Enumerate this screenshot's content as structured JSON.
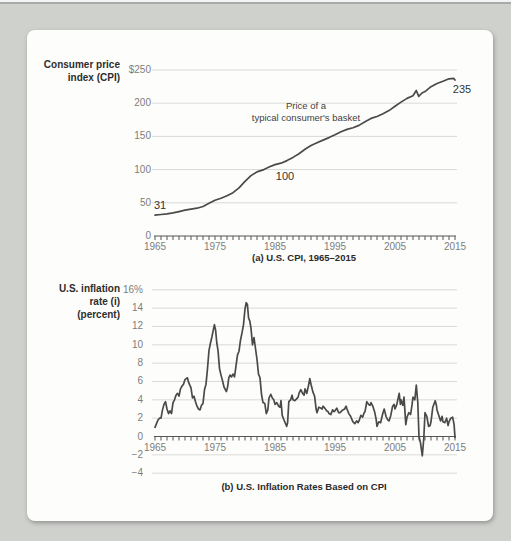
{
  "colors": {
    "page_bg": "#cfd1cd",
    "card_bg": "#fdfdfb",
    "top_rule": "#a9a9a9",
    "series_line": "#4a4a4a",
    "gridline": "#d9d9d9",
    "axis": "#555555",
    "tick_text": "#7d7d7d",
    "label_text": "#2d2d2d"
  },
  "chart_data": [
    {
      "id": "us-cpi",
      "type": "line",
      "title": "(a) U.S. CPI, 1965–2015",
      "ylabel_lines": [
        "Consumer price",
        "index (CPI)"
      ],
      "annotation_lines": [
        "Price of a",
        "typical consumer's basket"
      ],
      "point_labels": [
        {
          "text": "31",
          "year": 1965,
          "value": 31
        },
        {
          "text": "100",
          "year": 1983,
          "value": 100
        },
        {
          "text": "235",
          "year": 2015,
          "value": 235
        }
      ],
      "x_range": [
        1965,
        2015
      ],
      "ylim": [
        0,
        250
      ],
      "grid": true,
      "legend": "none",
      "yticks": [
        {
          "v": 250,
          "label": "$250"
        },
        {
          "v": 200,
          "label": "200"
        },
        {
          "v": 150,
          "label": "150"
        },
        {
          "v": 100,
          "label": "100"
        },
        {
          "v": 50,
          "label": "50"
        },
        {
          "v": 0,
          "label": "0"
        }
      ],
      "xticks": [
        1965,
        1975,
        1985,
        1995,
        2005,
        2015
      ],
      "series": [
        [
          1965,
          31.5
        ],
        [
          1966,
          32.4
        ],
        [
          1967,
          33.4
        ],
        [
          1968,
          34.8
        ],
        [
          1969,
          36.7
        ],
        [
          1970,
          38.8
        ],
        [
          1971,
          40.5
        ],
        [
          1972,
          41.8
        ],
        [
          1973,
          44.4
        ],
        [
          1974,
          49.3
        ],
        [
          1975,
          53.8
        ],
        [
          1976,
          56.9
        ],
        [
          1977,
          60.6
        ],
        [
          1978,
          65.2
        ],
        [
          1979,
          72.6
        ],
        [
          1980,
          82.4
        ],
        [
          1981,
          90.9
        ],
        [
          1982,
          96.5
        ],
        [
          1983,
          99.6
        ],
        [
          1984,
          103.9
        ],
        [
          1985,
          107.6
        ],
        [
          1986,
          109.6
        ],
        [
          1987,
          113.6
        ],
        [
          1988,
          118.3
        ],
        [
          1989,
          124.0
        ],
        [
          1990,
          130.7
        ],
        [
          1991,
          136.2
        ],
        [
          1992,
          140.3
        ],
        [
          1993,
          144.5
        ],
        [
          1994,
          148.2
        ],
        [
          1995,
          152.4
        ],
        [
          1996,
          156.9
        ],
        [
          1997,
          160.5
        ],
        [
          1998,
          163.0
        ],
        [
          1999,
          166.6
        ],
        [
          2000,
          172.2
        ],
        [
          2001,
          177.1
        ],
        [
          2002,
          179.9
        ],
        [
          2003,
          184.0
        ],
        [
          2004,
          188.9
        ],
        [
          2005,
          195.3
        ],
        [
          2006,
          201.6
        ],
        [
          2007,
          207.3
        ],
        [
          2008,
          211.1
        ],
        [
          2008.55,
          219.1
        ],
        [
          2008.95,
          210.2
        ],
        [
          2009.5,
          215.3
        ],
        [
          2010,
          217.5
        ],
        [
          2011,
          224.9
        ],
        [
          2012,
          229.6
        ],
        [
          2013,
          233.0
        ],
        [
          2014,
          236.7
        ],
        [
          2014.8,
          237.4
        ],
        [
          2015,
          234.8
        ]
      ]
    },
    {
      "id": "us-inflation",
      "type": "line",
      "title": "(b) U.S. Inflation Rates Based on CPI",
      "ylabel_lines": [
        "U.S. inflation",
        "rate (i)",
        "(percent)"
      ],
      "annotation_lines": [],
      "point_labels": [],
      "x_range": [
        1965,
        2015
      ],
      "ylim": [
        -4,
        16
      ],
      "grid": true,
      "legend": "none",
      "yticks": [
        {
          "v": 16,
          "label": "16%"
        },
        {
          "v": 14,
          "label": "14"
        },
        {
          "v": 12,
          "label": "12"
        },
        {
          "v": 10,
          "label": "10"
        },
        {
          "v": 8,
          "label": "8"
        },
        {
          "v": 6,
          "label": "6"
        },
        {
          "v": 4,
          "label": "4"
        },
        {
          "v": 2,
          "label": "2"
        },
        {
          "v": 0,
          "label": "0"
        },
        {
          "v": -2,
          "label": "−2"
        },
        {
          "v": -4,
          "label": "−4"
        }
      ],
      "xticks": [
        1965,
        1975,
        1985,
        1995,
        2005,
        2015
      ],
      "series": [
        [
          1965,
          1.0
        ],
        [
          1965.25,
          1.4
        ],
        [
          1965.5,
          1.8
        ],
        [
          1965.75,
          2.0
        ],
        [
          1966,
          2.0
        ],
        [
          1966.25,
          2.9
        ],
        [
          1966.5,
          3.5
        ],
        [
          1966.75,
          3.8
        ],
        [
          1967,
          3.0
        ],
        [
          1967.25,
          2.5
        ],
        [
          1967.5,
          2.8
        ],
        [
          1967.75,
          2.5
        ],
        [
          1968,
          3.7
        ],
        [
          1968.25,
          4.0
        ],
        [
          1968.5,
          4.5
        ],
        [
          1968.75,
          4.7
        ],
        [
          1969,
          4.4
        ],
        [
          1969.25,
          5.2
        ],
        [
          1969.5,
          5.5
        ],
        [
          1969.75,
          5.7
        ],
        [
          1970,
          6.2
        ],
        [
          1970.4,
          6.4
        ],
        [
          1970.6,
          5.9
        ],
        [
          1970.8,
          5.6
        ],
        [
          1971,
          5.3
        ],
        [
          1971.25,
          4.2
        ],
        [
          1971.5,
          4.4
        ],
        [
          1971.75,
          3.8
        ],
        [
          1972,
          3.3
        ],
        [
          1972.25,
          3.0
        ],
        [
          1972.5,
          2.9
        ],
        [
          1972.75,
          3.4
        ],
        [
          1973,
          3.6
        ],
        [
          1973.25,
          5.1
        ],
        [
          1973.5,
          5.7
        ],
        [
          1973.75,
          7.4
        ],
        [
          1974,
          9.4
        ],
        [
          1974.25,
          10.2
        ],
        [
          1974.5,
          10.9
        ],
        [
          1974.9,
          12.2
        ],
        [
          1975.1,
          11.6
        ],
        [
          1975.3,
          10.2
        ],
        [
          1975.5,
          9.4
        ],
        [
          1975.75,
          7.4
        ],
        [
          1976,
          6.7
        ],
        [
          1976.25,
          6.1
        ],
        [
          1976.5,
          5.4
        ],
        [
          1976.9,
          4.9
        ],
        [
          1977.1,
          5.4
        ],
        [
          1977.3,
          6.4
        ],
        [
          1977.5,
          6.7
        ],
        [
          1977.75,
          6.5
        ],
        [
          1978,
          6.8
        ],
        [
          1978.25,
          6.5
        ],
        [
          1978.5,
          7.7
        ],
        [
          1978.75,
          8.9
        ],
        [
          1979,
          9.3
        ],
        [
          1979.25,
          10.5
        ],
        [
          1979.5,
          11.3
        ],
        [
          1979.75,
          12.2
        ],
        [
          1980,
          13.9
        ],
        [
          1980.2,
          14.6
        ],
        [
          1980.4,
          14.4
        ],
        [
          1980.6,
          12.9
        ],
        [
          1980.8,
          12.6
        ],
        [
          1981,
          11.8
        ],
        [
          1981.25,
          10.0
        ],
        [
          1981.5,
          10.8
        ],
        [
          1981.75,
          9.6
        ],
        [
          1982,
          8.4
        ],
        [
          1982.25,
          6.8
        ],
        [
          1982.5,
          6.4
        ],
        [
          1982.75,
          4.6
        ],
        [
          1983,
          3.7
        ],
        [
          1983.3,
          3.6
        ],
        [
          1983.55,
          2.5
        ],
        [
          1983.8,
          2.9
        ],
        [
          1984,
          4.2
        ],
        [
          1984.3,
          4.6
        ],
        [
          1984.55,
          4.2
        ],
        [
          1984.8,
          4.0
        ],
        [
          1985,
          3.5
        ],
        [
          1985.3,
          3.7
        ],
        [
          1985.6,
          3.3
        ],
        [
          1985.85,
          3.2
        ],
        [
          1986,
          3.9
        ],
        [
          1986.2,
          2.3
        ],
        [
          1986.5,
          1.8
        ],
        [
          1986.95,
          1.1
        ],
        [
          1987.1,
          1.5
        ],
        [
          1987.3,
          3.8
        ],
        [
          1987.6,
          4.0
        ],
        [
          1987.85,
          4.5
        ],
        [
          1988,
          4.0
        ],
        [
          1988.3,
          3.9
        ],
        [
          1988.6,
          4.1
        ],
        [
          1988.85,
          4.3
        ],
        [
          1989,
          4.7
        ],
        [
          1989.3,
          5.1
        ],
        [
          1989.6,
          4.7
        ],
        [
          1989.85,
          4.5
        ],
        [
          1990,
          5.2
        ],
        [
          1990.3,
          4.7
        ],
        [
          1990.6,
          5.6
        ],
        [
          1990.8,
          6.3
        ],
        [
          1991,
          5.7
        ],
        [
          1991.3,
          4.9
        ],
        [
          1991.6,
          4.4
        ],
        [
          1991.85,
          3.0
        ],
        [
          1992,
          2.6
        ],
        [
          1992.3,
          3.2
        ],
        [
          1992.6,
          3.1
        ],
        [
          1992.85,
          3.0
        ],
        [
          1993,
          3.3
        ],
        [
          1993.3,
          3.1
        ],
        [
          1993.6,
          2.8
        ],
        [
          1993.85,
          2.7
        ],
        [
          1994,
          2.5
        ],
        [
          1994.3,
          2.4
        ],
        [
          1994.6,
          2.9
        ],
        [
          1994.85,
          2.7
        ],
        [
          1995,
          2.8
        ],
        [
          1995.3,
          3.1
        ],
        [
          1995.6,
          2.6
        ],
        [
          1995.85,
          2.6
        ],
        [
          1996,
          2.7
        ],
        [
          1996.3,
          2.9
        ],
        [
          1996.6,
          3.0
        ],
        [
          1996.85,
          3.3
        ],
        [
          1997,
          3.0
        ],
        [
          1997.3,
          2.5
        ],
        [
          1997.6,
          2.2
        ],
        [
          1997.85,
          1.8
        ],
        [
          1998,
          1.6
        ],
        [
          1998.3,
          1.4
        ],
        [
          1998.6,
          1.7
        ],
        [
          1998.85,
          1.5
        ],
        [
          1999,
          1.7
        ],
        [
          1999.3,
          2.3
        ],
        [
          1999.6,
          2.1
        ],
        [
          1999.85,
          2.6
        ],
        [
          2000,
          2.7
        ],
        [
          2000.3,
          3.8
        ],
        [
          2000.6,
          3.5
        ],
        [
          2000.85,
          3.4
        ],
        [
          2001,
          3.7
        ],
        [
          2001.3,
          3.3
        ],
        [
          2001.6,
          2.7
        ],
        [
          2001.85,
          1.9
        ],
        [
          2002,
          1.1
        ],
        [
          2002.3,
          1.6
        ],
        [
          2002.6,
          1.5
        ],
        [
          2002.85,
          2.2
        ],
        [
          2003,
          2.6
        ],
        [
          2003.2,
          3.0
        ],
        [
          2003.5,
          2.2
        ],
        [
          2003.8,
          1.8
        ],
        [
          2004,
          1.7
        ],
        [
          2004.3,
          2.3
        ],
        [
          2004.6,
          3.3
        ],
        [
          2004.85,
          3.5
        ],
        [
          2005,
          3.0
        ],
        [
          2005.3,
          3.5
        ],
        [
          2005.7,
          4.7
        ],
        [
          2005.9,
          3.5
        ],
        [
          2006,
          4.0
        ],
        [
          2006.3,
          3.4
        ],
        [
          2006.5,
          4.3
        ],
        [
          2006.8,
          1.3
        ],
        [
          2007,
          2.1
        ],
        [
          2007.3,
          2.6
        ],
        [
          2007.6,
          2.4
        ],
        [
          2007.85,
          3.5
        ],
        [
          2008,
          4.3
        ],
        [
          2008.3,
          4.0
        ],
        [
          2008.55,
          5.6
        ],
        [
          2008.8,
          3.7
        ],
        [
          2009,
          0.0
        ],
        [
          2009.25,
          -0.7
        ],
        [
          2009.55,
          -2.1
        ],
        [
          2009.8,
          -0.2
        ],
        [
          2010,
          2.6
        ],
        [
          2010.3,
          2.2
        ],
        [
          2010.6,
          1.1
        ],
        [
          2010.85,
          1.2
        ],
        [
          2011,
          1.6
        ],
        [
          2011.3,
          3.2
        ],
        [
          2011.7,
          3.9
        ],
        [
          2011.9,
          3.4
        ],
        [
          2012,
          2.9
        ],
        [
          2012.3,
          2.3
        ],
        [
          2012.6,
          1.7
        ],
        [
          2012.85,
          2.2
        ],
        [
          2013,
          1.6
        ],
        [
          2013.3,
          1.5
        ],
        [
          2013.6,
          2.0
        ],
        [
          2013.85,
          1.2
        ],
        [
          2014,
          1.6
        ],
        [
          2014.3,
          2.0
        ],
        [
          2014.6,
          2.1
        ],
        [
          2014.85,
          1.3
        ],
        [
          2015,
          -0.1
        ]
      ]
    }
  ]
}
